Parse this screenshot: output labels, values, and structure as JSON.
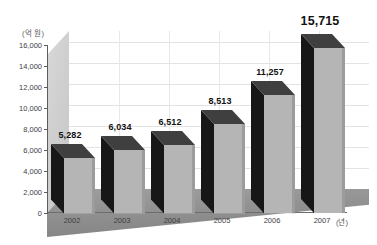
{
  "chart_data": {
    "type": "bar",
    "title": "",
    "subtitle": "",
    "xlabel": "(년)",
    "ylabel": "(억 원)",
    "categories": [
      "2002",
      "2003",
      "2004",
      "2005",
      "2006",
      "2007"
    ],
    "values": [
      5282,
      6034,
      6512,
      8513,
      11257,
      15715
    ],
    "value_labels": [
      "5,282",
      "6,034",
      "6,512",
      "8,513",
      "11,257",
      "15,715"
    ],
    "ylim": [
      0,
      16000
    ],
    "ytick_values": [
      0,
      2000,
      4000,
      6000,
      8000,
      10000,
      12000,
      14000,
      16000
    ],
    "ytick_labels": [
      "0",
      "2,000",
      "4,000",
      "6,000",
      "8,000",
      "10,000",
      "12,000",
      "14,000",
      "16,000"
    ],
    "grid": true,
    "legend": false,
    "legend_position": "none",
    "style": "3d-column",
    "series": [
      {
        "name": "value",
        "values": [
          5282,
          6034,
          6512,
          8513,
          11257,
          15715
        ]
      }
    ]
  },
  "colors": {
    "bar_front": "#b6b6b6",
    "bar_side": "#161616",
    "bar_top": "#414141",
    "floor": "#8d8d8d",
    "wall_left": "#cfcfcf",
    "grid": "#e3e3e3",
    "axis": "#5d5d5d",
    "text": "#3e3e42",
    "background": "#ffffff"
  }
}
